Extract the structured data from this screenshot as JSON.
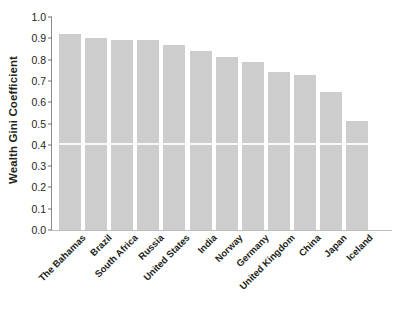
{
  "chart_data": {
    "type": "bar",
    "title": "",
    "xlabel": "",
    "ylabel": "Wealth Gini Coefficient",
    "ylim": [
      0.0,
      1.0
    ],
    "ytick_labels": [
      "1.0",
      "0.9",
      "0.8",
      "0.7",
      "0.6",
      "0.5",
      "0.4",
      "0.3",
      "0.2",
      "0.1",
      "0.0"
    ],
    "ytick_values": [
      1.0,
      0.9,
      0.8,
      0.7,
      0.6,
      0.5,
      0.4,
      0.3,
      0.2,
      0.1,
      0.0
    ],
    "grid": false,
    "legend": null,
    "bar_color": "#cdcdcd",
    "categories": [
      "The Bahamas",
      "Brazil",
      "South Africa",
      "Russia",
      "United States",
      "India",
      "Norway",
      "Germany",
      "United Kingdom",
      "China",
      "Japan",
      "Iceland"
    ],
    "values": [
      0.92,
      0.9,
      0.89,
      0.89,
      0.87,
      0.84,
      0.81,
      0.79,
      0.74,
      0.73,
      0.65,
      0.51
    ]
  }
}
